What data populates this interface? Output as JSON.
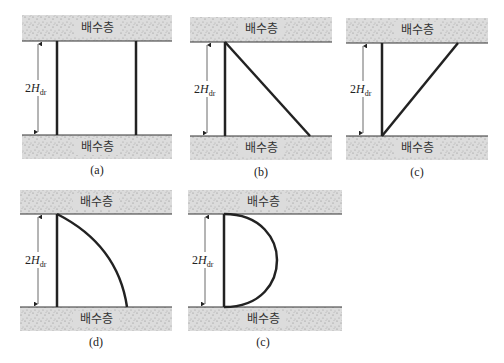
{
  "figure": {
    "layer_label": "배수층",
    "dimension": {
      "prefix": "2",
      "var": "H",
      "sub": "dr"
    },
    "colors": {
      "layer_fill": "#d9d9d9",
      "speckle": "#8a8a8a",
      "line": "#222222"
    },
    "panels": [
      {
        "id": "a",
        "caption": "(a)",
        "shape": "rectangle"
      },
      {
        "id": "b",
        "caption": "(b)",
        "shape": "triangle-top-max"
      },
      {
        "id": "c",
        "caption": "(c)",
        "shape": "triangle-bottom-max"
      },
      {
        "id": "d",
        "caption": "(d)",
        "shape": "curve-decreasing"
      },
      {
        "id": "e",
        "caption": "(c)",
        "shape": "half-parabola"
      }
    ]
  }
}
